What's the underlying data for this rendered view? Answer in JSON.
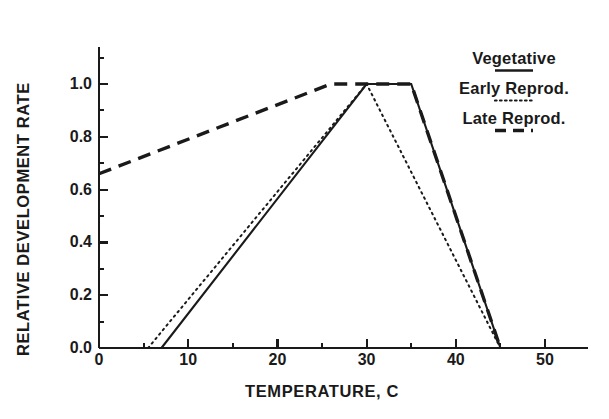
{
  "chart_data": {
    "type": "line",
    "title": "",
    "xlabel": "TEMPERATURE, C",
    "ylabel": "RELATIVE DEVELOPMENT RATE",
    "xlim": [
      0,
      55
    ],
    "ylim": [
      0.0,
      1.12
    ],
    "xticks": [
      0,
      10,
      20,
      30,
      40,
      50
    ],
    "xtick_labels": [
      "0",
      "10",
      "20",
      "30",
      "40",
      "50"
    ],
    "xminor_ticks": [
      5,
      15,
      25,
      35,
      45
    ],
    "yticks": [
      0.0,
      0.2,
      0.4,
      0.6,
      0.8,
      1.0
    ],
    "ytick_labels": [
      "0.0",
      "0.2",
      "0.4",
      "0.6",
      "0.8",
      "1.0"
    ],
    "yminor_ticks": [
      0.1,
      0.3,
      0.5,
      0.7,
      0.9,
      1.1
    ],
    "grid": false,
    "legend_position": "upper right",
    "series": [
      {
        "name": "Vegetative",
        "style": "solid",
        "color": "#1a1a1a",
        "x": [
          7,
          30,
          35,
          45
        ],
        "y": [
          0.0,
          1.0,
          1.0,
          0.0
        ]
      },
      {
        "name": "Early Reprod.",
        "style": "dotted",
        "color": "#1a1a1a",
        "x": [
          5.5,
          30,
          45
        ],
        "y": [
          0.0,
          1.0,
          0.0
        ]
      },
      {
        "name": "Late Reprod.",
        "style": "dashed",
        "color": "#1a1a1a",
        "x": [
          0,
          26,
          35,
          45
        ],
        "y": [
          0.66,
          1.0,
          1.0,
          0.0
        ]
      }
    ]
  },
  "legend": {
    "entries": [
      {
        "label": "Vegetative",
        "style": "solid"
      },
      {
        "label": "Early Reprod.",
        "style": "dotted"
      },
      {
        "label": "Late Reprod.",
        "style": "dashed"
      }
    ]
  },
  "axes": {
    "x_title": "TEMPERATURE, C",
    "y_title": "RELATIVE DEVELOPMENT RATE"
  }
}
